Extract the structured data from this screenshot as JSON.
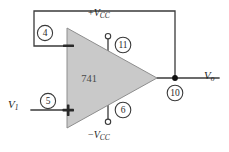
{
  "figure": {
    "name": "op-amp-voltage-follower-741",
    "type": "schematic",
    "width": 229,
    "height": 152,
    "background_color": "#ffffff"
  },
  "opamp": {
    "part_number": "741",
    "body_fill": "#c9c9c9",
    "body_stroke": "#8e8e8e",
    "inverting_sign": "−",
    "noninverting_sign": "+"
  },
  "pins": [
    {
      "id": "pin-4",
      "number": "4",
      "function": "inverting-input",
      "cx": 45,
      "cy": 33
    },
    {
      "id": "pin-5",
      "number": "5",
      "function": "noninverting-input",
      "cx": 48,
      "cy": 101
    },
    {
      "id": "pin-11",
      "number": "11",
      "function": "positive-supply",
      "cx": 123,
      "cy": 45
    },
    {
      "id": "pin-6",
      "number": "6",
      "function": "negative-supply",
      "cx": 123,
      "cy": 110
    },
    {
      "id": "pin-10",
      "number": "10",
      "function": "output",
      "cx": 175,
      "cy": 93
    }
  ],
  "labels": {
    "supply_positive_sign": "+",
    "supply_positive_symbol": "V",
    "supply_positive_subscript": "CC",
    "supply_negative_sign": "−",
    "supply_negative_symbol": "V",
    "supply_negative_subscript": "CC",
    "input_symbol": "V",
    "input_subscript": "1",
    "output_symbol": "V",
    "output_subscript": "o"
  },
  "wires": {
    "feedback_path": "M68,46 L34,46 L34,11 L175,11 L175,78",
    "input_path": "M31,110 L68,110",
    "output_path": "M157,78 L219,78",
    "supply_pos_path": "M108,39 L108,60",
    "supply_neg_path": "M108,96 L108,119",
    "stroke_color": "#3a3a3a"
  },
  "colors": {
    "wire": "#3a3a3a",
    "body": "#c9c9c9",
    "node": "#111111",
    "text": "#1f1f1f"
  }
}
